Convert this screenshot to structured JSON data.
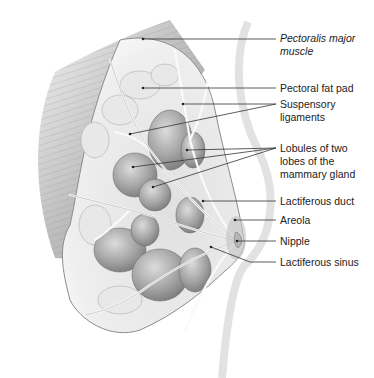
{
  "figure": {
    "style": "grayscale pencil illustration"
  },
  "labels": [
    {
      "id": "pectoralis",
      "lines": [
        "Pectoralis major",
        "muscle"
      ],
      "italic": true,
      "y": 22,
      "anchors": [
        [
          143,
          39
        ]
      ]
    },
    {
      "id": "fatpad",
      "lines": [
        "Pectoral fat pad"
      ],
      "italic": false,
      "y": 82,
      "anchors": [
        [
          143,
          88
        ]
      ]
    },
    {
      "id": "suspensory",
      "lines": [
        "Suspensory",
        "ligaments"
      ],
      "italic": false,
      "y": 100,
      "anchors": [
        [
          183,
          104
        ],
        [
          130,
          134
        ]
      ]
    },
    {
      "id": "lobules",
      "lines": [
        "Lobules of two",
        "lobes of the",
        "mammary gland"
      ],
      "italic": false,
      "y": 141,
      "anchors": [
        [
          187,
          150
        ],
        [
          133,
          167
        ],
        [
          153,
          187
        ]
      ]
    },
    {
      "id": "duct",
      "lines": [
        "Lactiferous duct"
      ],
      "italic": false,
      "y": 193,
      "anchors": [
        [
          203,
          201
        ]
      ]
    },
    {
      "id": "areola",
      "lines": [
        "Areola"
      ],
      "italic": false,
      "y": 213,
      "anchors": [
        [
          235,
          220
        ]
      ]
    },
    {
      "id": "nipple",
      "lines": [
        "Nipple"
      ],
      "italic": false,
      "y": 233,
      "anchors": [
        [
          237,
          241
        ]
      ]
    },
    {
      "id": "sinus",
      "lines": [
        "Lactiferous sinus"
      ],
      "italic": false,
      "y": 253,
      "anchors": [
        [
          211,
          247
        ]
      ]
    }
  ],
  "text": {
    "pectoralis_1": "Pectoralis major",
    "pectoralis_2": "muscle",
    "fatpad": "Pectoral fat pad",
    "suspensory_1": "Suspensory",
    "suspensory_2": "ligaments",
    "lobules_1": "Lobules of two",
    "lobules_2": "lobes of the",
    "lobules_3": "mammary gland",
    "duct": "Lactiferous duct",
    "areola": "Areola",
    "nipple": "Nipple",
    "sinus": "Lactiferous sinus"
  },
  "colors": {
    "line": "#333333",
    "muscle": "#b8b8b8",
    "tissue": "#d4d4d4",
    "lobule": "#9a9a9a",
    "skin": "#e6e6e6"
  }
}
